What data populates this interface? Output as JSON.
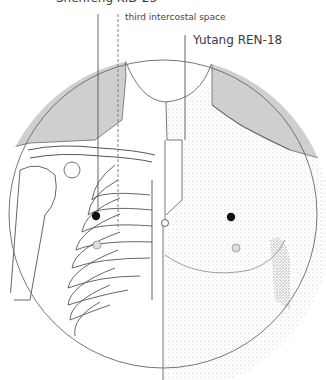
{
  "labels": {
    "top_clipped": "Shenfeng KID-23",
    "third_intercostal": "third intercostal space",
    "yutang": "Yutang REN-18"
  },
  "colors": {
    "outline": "#555555",
    "shade": "#cfcfcf",
    "point": "#111111"
  },
  "points": [
    {
      "name": "left-chest-point",
      "x": 96,
      "y": 216
    },
    {
      "name": "right-chest-point",
      "x": 231,
      "y": 217
    },
    {
      "name": "yutang-point",
      "x": 165,
      "y": 223
    }
  ]
}
